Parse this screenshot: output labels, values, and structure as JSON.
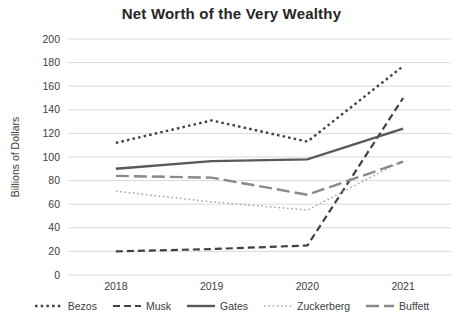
{
  "title": "Net Worth of the Very Wealthy",
  "chart_data": {
    "type": "line",
    "x": [
      "2018",
      "2019",
      "2020",
      "2021"
    ],
    "xlabel": "",
    "ylabel": "Billions of Dollars",
    "ylim": [
      0,
      200
    ],
    "ytick_step": 20,
    "yticks": [
      0,
      20,
      40,
      60,
      80,
      100,
      120,
      140,
      160,
      180,
      200
    ],
    "grid": true,
    "legend_position": "bottom",
    "gridline_color": "#d9d9d9",
    "axis_text_color": "#404040",
    "title_color": "#262626",
    "series": [
      {
        "name": "Bezos",
        "values": [
          112,
          131,
          113,
          177
        ],
        "color": "#404040",
        "style": "dotted"
      },
      {
        "name": "Musk",
        "values": [
          20,
          22,
          25,
          150
        ],
        "color": "#404040",
        "style": "dashed"
      },
      {
        "name": "Gates",
        "values": [
          90,
          96.5,
          98,
          124
        ],
        "color": "#595959",
        "style": "solid"
      },
      {
        "name": "Zuckerberg",
        "values": [
          71,
          62,
          55,
          97
        ],
        "color": "#a6a6a6",
        "style": "fine-dotted"
      },
      {
        "name": "Buffett",
        "values": [
          84,
          82.5,
          68,
          96
        ],
        "color": "#8a8a8a",
        "style": "long-dashed"
      }
    ]
  }
}
